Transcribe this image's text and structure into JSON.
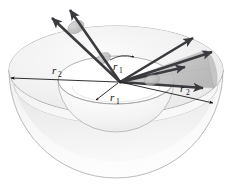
{
  "figure": {
    "background_color": "#ffffff",
    "width": 233,
    "height": 195
  },
  "labels": {
    "radius_outer_left": {
      "symbol": "r",
      "subscript": "2",
      "text": "r2"
    },
    "radius_inner_upper": {
      "symbol": "r",
      "subscript": "1",
      "text": "r1"
    },
    "radius_inner_lower": {
      "symbol": "r",
      "subscript": "1",
      "text": "r1"
    },
    "radius_outer_right": {
      "symbol": "r",
      "subscript": "2",
      "text": "r2"
    }
  },
  "colors": {
    "arrow_dark": "#3a3a3f",
    "arrow_outline": "#2b2b30",
    "dimension_line": "#1a1a1a",
    "surface_light": "#f6f6f6",
    "surface_mid": "#e9e9e9",
    "surface_shade": "#dcdcdc",
    "cone_fill": "#c9c9c9",
    "outline": "#9a9a9a",
    "background": "#ffffff",
    "text": "#101010"
  },
  "geometry": {
    "origin": {
      "x": 120,
      "y": 82
    },
    "outer_rim": {
      "cx": 116,
      "cy": 70,
      "rx": 107,
      "ry": 44
    },
    "inner_rim": {
      "cx": 116,
      "cy": 80,
      "rx": 58,
      "ry": 24
    },
    "outer_bowl_depth": 108,
    "inner_bowl_depth": 52
  },
  "ray_bundles": [
    {
      "name": "upper-left-bundle",
      "direction": "up-left",
      "count": 2,
      "has_cone_cross_section": true
    },
    {
      "name": "right-bundle",
      "direction": "right",
      "count": 4,
      "has_cone_cross_section": true
    }
  ],
  "dimension_arrows": [
    {
      "name": "outer-radius-left",
      "label": "r2",
      "style": "double-headed"
    },
    {
      "name": "inner-radius-upper",
      "label": "r1",
      "style": "arc-arrow"
    },
    {
      "name": "inner-radius-lower",
      "label": "r1",
      "style": "single-headed"
    },
    {
      "name": "outer-radius-right",
      "label": "r2",
      "style": "single-headed"
    }
  ]
}
